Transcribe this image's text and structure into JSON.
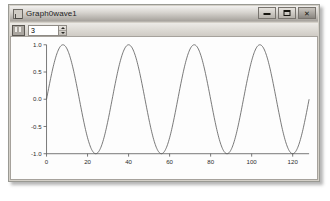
{
  "window": {
    "title": "Graph0wave1",
    "icon": "graph-window-icon",
    "controls": [
      {
        "name": "minimize",
        "glyph": "dash"
      },
      {
        "name": "maximize",
        "glyph": "square"
      },
      {
        "name": "close",
        "glyph": "✕"
      }
    ]
  },
  "toolbar": {
    "frequency_icon": "frequency-icon",
    "frequency_value": "3",
    "spin_up_label": "▲",
    "spin_down_label": "▼"
  },
  "chart_data": {
    "type": "line",
    "title": "",
    "xlabel": "",
    "ylabel": "",
    "xlim": [
      0,
      128
    ],
    "ylim": [
      -1.0,
      1.0
    ],
    "grid": false,
    "legend": null,
    "line_color": "#555555",
    "xticks": [
      0,
      20,
      40,
      60,
      80,
      100,
      120
    ],
    "xtick_labels": [
      "0",
      "20",
      "40",
      "60",
      "80",
      "100",
      "120"
    ],
    "yticks": [
      -1.0,
      -0.5,
      0.0,
      0.5,
      1.0
    ],
    "ytick_labels": [
      "-1.0",
      "-0.5",
      "0.0",
      "0.5",
      "1.0"
    ],
    "series": [
      {
        "name": "wave1",
        "waveform": "sine",
        "amplitude": 1.0,
        "cycles": 4,
        "period": 32,
        "phase": 0,
        "x_start": 0,
        "x_end": 128,
        "samples": 512
      }
    ]
  }
}
